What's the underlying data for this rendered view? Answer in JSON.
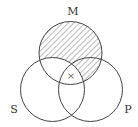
{
  "diagram": {
    "type": "venn",
    "labels": {
      "m": "M",
      "s": "S",
      "p": "P"
    },
    "mark": "×",
    "shaded_regions": [
      "M only",
      "M and P not S"
    ],
    "marked_region": "M and S and P",
    "colors": {
      "stroke": "#444444",
      "hatch": "#555555",
      "text": "#333333"
    }
  }
}
